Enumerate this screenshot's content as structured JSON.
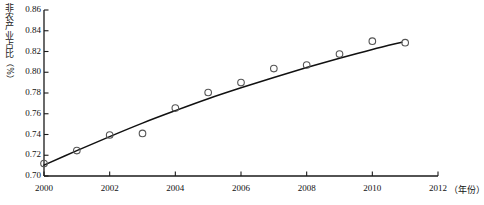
{
  "chart_data": {
    "type": "scatter",
    "title": "",
    "xlabel": "年份",
    "ylabel": "非农产业占比（%）",
    "ylabel_chars": [
      "非",
      "农",
      "产",
      "业",
      "占",
      "比",
      "（",
      "%",
      "）"
    ],
    "xlim": [
      2000,
      2012
    ],
    "ylim": [
      0.7,
      0.86
    ],
    "grid": false,
    "legend": null,
    "xticks": [
      "2000",
      "2002",
      "2004",
      "2006",
      "2008",
      "2010",
      "2012"
    ],
    "xtick_values": [
      2000,
      2002,
      2004,
      2006,
      2008,
      2010,
      2012
    ],
    "yticks": [
      "0.70",
      "0.72",
      "0.74",
      "0.76",
      "0.78",
      "0.80",
      "0.82",
      "0.84",
      "0.86"
    ],
    "ytick_values": [
      0.7,
      0.72,
      0.74,
      0.76,
      0.78,
      0.8,
      0.82,
      0.84,
      0.86
    ],
    "x_axis_unit": "（年份）",
    "marker": "open-circle",
    "series": [
      {
        "name": "非农产业占比",
        "kind": "scatter",
        "x": [
          2000,
          2001,
          2002,
          2003,
          2004,
          2005,
          2006,
          2007,
          2008,
          2009,
          2010,
          2011
        ],
        "values": [
          0.712,
          0.7245,
          0.7395,
          0.741,
          0.7655,
          0.7805,
          0.79,
          0.8035,
          0.807,
          0.8175,
          0.83,
          0.8285
        ]
      },
      {
        "name": "拟合曲线",
        "kind": "fit-curve",
        "x": [
          2000,
          2001,
          2002,
          2003,
          2004,
          2005,
          2006,
          2007,
          2008,
          2009,
          2010,
          2010.9
        ],
        "values": [
          0.7105,
          0.7245,
          0.738,
          0.751,
          0.763,
          0.7745,
          0.785,
          0.795,
          0.8045,
          0.8135,
          0.822,
          0.829
        ]
      }
    ],
    "colors": {
      "axis": "#1a1a1a",
      "marker_stroke": "#555555",
      "curve": "#111111",
      "background": "#ffffff"
    }
  }
}
